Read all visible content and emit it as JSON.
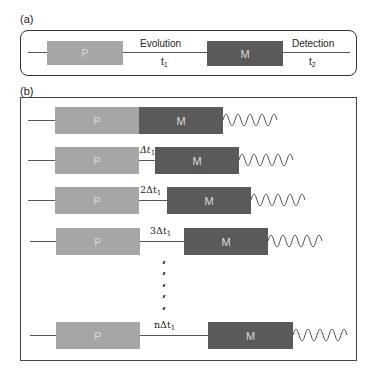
{
  "panel_a": {
    "label": "(a)",
    "pulse_label": "P",
    "mixing_label": "M",
    "evolution_label": "Evolution",
    "evolution_time": "t",
    "evolution_time_sub": "1",
    "detection_label": "Detection",
    "detection_time": "t",
    "detection_time_sub": "2"
  },
  "panel_b": {
    "label": "(b)",
    "rows": [
      {
        "p": "P",
        "m": "M",
        "delay": "",
        "delay_sub": ""
      },
      {
        "p": "P",
        "m": "M",
        "delay": "Δt",
        "delay_sub": "1"
      },
      {
        "p": "P",
        "m": "M",
        "delay": "2Δt",
        "delay_sub": "1"
      },
      {
        "p": "P",
        "m": "M",
        "delay": "3Δt",
        "delay_sub": "1"
      },
      {
        "p": "P",
        "m": "M",
        "delay": "nΔt",
        "delay_sub": "1"
      }
    ]
  },
  "colors": {
    "pulse_block": "#a6a6a6",
    "mixing_block": "#5a5a5a",
    "line": "#555555"
  }
}
